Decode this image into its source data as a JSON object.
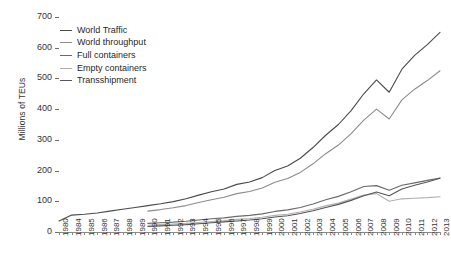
{
  "chart_data": {
    "type": "line",
    "title": "",
    "xlabel": "",
    "ylabel": "Millions of TEUs",
    "ylim": [
      0,
      700
    ],
    "yticks": [
      0,
      100,
      200,
      300,
      400,
      500,
      600,
      700
    ],
    "grid": false,
    "legend_position": "top-left",
    "x": [
      1980,
      1984,
      1985,
      1986,
      1987,
      1988,
      1989,
      1990,
      1991,
      1992,
      1993,
      1994,
      1995,
      1996,
      1997,
      1998,
      1999,
      2000,
      2001,
      2002,
      2003,
      2004,
      2005,
      2006,
      2007,
      2008,
      2009,
      2010,
      2011,
      2012,
      2013
    ],
    "xtick_labels": [
      "1980",
      "1984",
      "1985",
      "1986",
      "1987",
      "1988",
      "1989",
      "1990",
      "1991",
      "1992",
      "1993",
      "1994",
      "1995",
      "1996",
      "1997",
      "1998",
      "1999",
      "2000",
      "2001",
      "2002",
      "2003",
      "2004",
      "2005",
      "2006",
      "2007",
      "2008",
      "2009",
      "2010",
      "2011",
      "2012",
      "2013"
    ],
    "series": [
      {
        "name": "World Traffic",
        "color": "#4a4a4a",
        "x": [
          1980,
          1984,
          1985,
          1986,
          1987,
          1988,
          1989,
          1990,
          1991,
          1992,
          1993,
          1994,
          1995,
          1996,
          1997,
          1998,
          1999,
          2000,
          2001,
          2002,
          2003,
          2004,
          2005,
          2006,
          2007,
          2008,
          2009,
          2010,
          2011,
          2012,
          2013
        ],
        "values": [
          36,
          55,
          58,
          62,
          68,
          74,
          80,
          86,
          92,
          99,
          108,
          120,
          131,
          140,
          155,
          163,
          177,
          200,
          215,
          240,
          275,
          315,
          350,
          395,
          450,
          495,
          455,
          530,
          575,
          610,
          650
        ]
      },
      {
        "name": "World throughput",
        "color": "#8c8c8c",
        "x": [
          1990,
          1991,
          1992,
          1993,
          1994,
          1995,
          1996,
          1997,
          1998,
          1999,
          2000,
          2001,
          2002,
          2003,
          2004,
          2005,
          2006,
          2007,
          2008,
          2009,
          2010,
          2011,
          2012,
          2013
        ],
        "values": [
          68,
          73,
          79,
          86,
          96,
          105,
          113,
          125,
          132,
          143,
          162,
          174,
          194,
          222,
          255,
          283,
          320,
          364,
          400,
          368,
          430,
          465,
          493,
          525
        ]
      },
      {
        "name": "Full containers",
        "color": "#6a6a6a",
        "x": [
          1990,
          1991,
          1992,
          1993,
          1994,
          1995,
          1996,
          1997,
          1998,
          1999,
          2000,
          2001,
          2002,
          2003,
          2004,
          2005,
          2006,
          2007,
          2008,
          2009,
          2010,
          2011,
          2012,
          2013
        ],
        "values": [
          28,
          30,
          32,
          35,
          39,
          43,
          46,
          51,
          54,
          59,
          67,
          72,
          80,
          91,
          105,
          116,
          131,
          148,
          151,
          136,
          152,
          160,
          168,
          176
        ]
      },
      {
        "name": "Empty containers",
        "color": "#b0b0b0",
        "x": [
          1990,
          1991,
          1992,
          1993,
          1994,
          1995,
          1996,
          1997,
          1998,
          1999,
          2000,
          2001,
          2002,
          2003,
          2004,
          2005,
          2006,
          2007,
          2008,
          2009,
          2010,
          2011,
          2012,
          2013
        ],
        "values": [
          22,
          24,
          26,
          28,
          31,
          34,
          37,
          41,
          44,
          48,
          54,
          58,
          65,
          74,
          85,
          94,
          107,
          120,
          125,
          100,
          108,
          110,
          112,
          115
        ]
      },
      {
        "name": "Transshipment",
        "color": "#555555",
        "x": [
          1990,
          1991,
          1992,
          1993,
          1994,
          1995,
          1996,
          1997,
          1998,
          1999,
          2000,
          2001,
          2002,
          2003,
          2004,
          2005,
          2006,
          2007,
          2008,
          2009,
          2010,
          2011,
          2012,
          2013
        ],
        "values": [
          18,
          20,
          22,
          24,
          27,
          30,
          33,
          36,
          39,
          43,
          49,
          53,
          60,
          69,
          80,
          90,
          103,
          118,
          130,
          118,
          140,
          152,
          163,
          175
        ]
      }
    ]
  },
  "legend": {
    "items": [
      {
        "label": "World Traffic"
      },
      {
        "label": "World throughput"
      },
      {
        "label": "Full containers"
      },
      {
        "label": "Empty containers"
      },
      {
        "label": "Transshipment"
      }
    ]
  }
}
